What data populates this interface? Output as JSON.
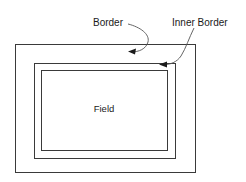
{
  "diagram": {
    "background_color": "#ffffff",
    "stroke_color": "#3a3a3a",
    "leader_color": "#555555",
    "text_color": "#1a1a1a",
    "labels": {
      "border": "Border",
      "inner_border": "Inner Border",
      "field": "Field"
    },
    "shapes": {
      "outer_rect": {
        "x": 15,
        "y": 44,
        "width": 180,
        "height": 128
      },
      "middle_rect": {
        "x": 34,
        "y": 63,
        "width": 141,
        "height": 95
      },
      "inner_rect": {
        "x": 41,
        "y": 70,
        "width": 126,
        "height": 80
      }
    },
    "annotations": [
      {
        "name": "border",
        "label": "Border",
        "label_x": 93,
        "label_y": 26,
        "target_x": 130,
        "target_y": 52
      },
      {
        "name": "inner-border",
        "label": "Inner Border",
        "label_x": 172,
        "label_y": 26,
        "target_x": 160,
        "target_y": 64
      }
    ]
  }
}
